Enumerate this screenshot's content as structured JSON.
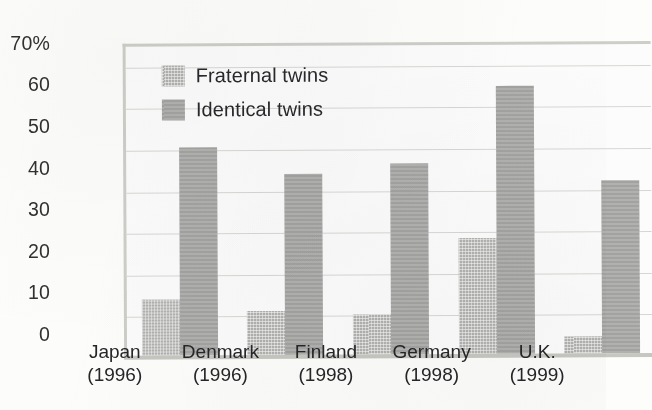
{
  "chart_data": {
    "type": "bar",
    "title": "",
    "subtitle": "",
    "xlabel": "",
    "ylabel": "",
    "categories": [
      "Japan\n(1996)",
      "Denmark\n(1996)",
      "Finland\n(1998)",
      "Germany\n(1998)",
      "U.K.\n(1999)"
    ],
    "category_names": [
      "Japan",
      "Denmark",
      "Finland",
      "Germany",
      "U.K."
    ],
    "category_years": [
      "(1996)",
      "(1996)",
      "(1998)",
      "(1998)",
      "(1999)"
    ],
    "series": [
      {
        "name": "Fraternal twins",
        "values": [
          13.5,
          10.5,
          9.5,
          28,
          4
        ],
        "color": "#b2b2b0",
        "fill": "dotted-light-gray"
      },
      {
        "name": "Identical twins",
        "values": [
          50,
          43.5,
          46,
          64.5,
          41.5
        ],
        "color": "#a5a5a3",
        "fill": "solid-gray"
      }
    ],
    "ylim": [
      0,
      75
    ],
    "yticks": [
      0,
      10,
      20,
      30,
      40,
      50,
      60,
      70
    ],
    "ytick_labels": [
      "0",
      "10",
      "20",
      "30",
      "40",
      "50",
      "60",
      "70%"
    ],
    "grid": true,
    "grid_axis": "y",
    "legend_position": "top-left-inside",
    "units": "percent"
  },
  "legend": {
    "items": [
      {
        "label": "Fraternal twins",
        "swatch": "legend-swatch-fraternal"
      },
      {
        "label": "Identical twins",
        "swatch": "legend-swatch-identical"
      }
    ]
  },
  "colors": {
    "background": "#fdfdfb",
    "plot_background": "#ffffff",
    "gridline": "#d8d8d4",
    "axis": "#cfcfca",
    "text": "#26262a",
    "bar_fraternal": "#b2b2b0",
    "bar_identical": "#a5a5a3"
  }
}
